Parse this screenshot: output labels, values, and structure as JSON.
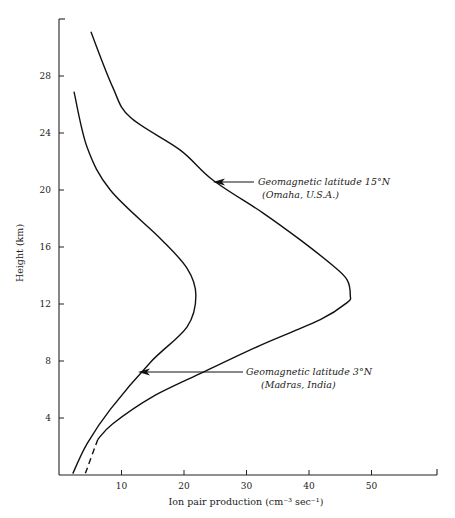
{
  "chart_data": {
    "type": "line",
    "title": "",
    "xlabel": "Ion pair production (cm⁻³ sec⁻¹)",
    "ylabel": "Height (km)",
    "xlim": [
      0,
      60
    ],
    "ylim": [
      0,
      32
    ],
    "x_ticks": [
      10,
      20,
      30,
      40,
      50
    ],
    "y_ticks": [
      4,
      8,
      12,
      16,
      20,
      24,
      28
    ],
    "grid": false,
    "legend": "none (inline annotations with arrows)",
    "series": [
      {
        "name": "Geomagnetic latitude 15°N (Omaha, U.S.A.)",
        "style": "solid; dashed below ~2.5 km",
        "points": [
          {
            "x": 5.1,
            "y": 31.1
          },
          {
            "x": 8.6,
            "y": 27.2
          },
          {
            "x": 11.4,
            "y": 25.1
          },
          {
            "x": 19.4,
            "y": 22.8
          },
          {
            "x": 24.6,
            "y": 20.7
          },
          {
            "x": 32.6,
            "y": 18.4
          },
          {
            "x": 38.6,
            "y": 16.5
          },
          {
            "x": 43.8,
            "y": 14.7
          },
          {
            "x": 46.1,
            "y": 13.7
          },
          {
            "x": 46.6,
            "y": 12.6
          },
          {
            "x": 46.1,
            "y": 12.1
          },
          {
            "x": 41.8,
            "y": 10.9
          },
          {
            "x": 32.2,
            "y": 9.1
          },
          {
            "x": 23.0,
            "y": 7.2
          },
          {
            "x": 15.0,
            "y": 5.5
          },
          {
            "x": 8.6,
            "y": 3.6
          },
          {
            "x": 6.2,
            "y": 2.5
          },
          {
            "x": 4.2,
            "y": 0.1
          }
        ]
      },
      {
        "name": "Geomagnetic latitude 3°N (Madras, India)",
        "style": "solid",
        "points": [
          {
            "x": 2.4,
            "y": 26.9
          },
          {
            "x": 4.5,
            "y": 23.0
          },
          {
            "x": 8.2,
            "y": 20.0
          },
          {
            "x": 16.2,
            "y": 16.6
          },
          {
            "x": 20.5,
            "y": 14.5
          },
          {
            "x": 21.9,
            "y": 12.6
          },
          {
            "x": 20.5,
            "y": 10.4
          },
          {
            "x": 14.6,
            "y": 7.9
          },
          {
            "x": 8.2,
            "y": 4.6
          },
          {
            "x": 4.5,
            "y": 2.2
          },
          {
            "x": 2.2,
            "y": 0.1
          }
        ]
      }
    ],
    "annotations": [
      {
        "line1": "Geomagnetic latitude 15°N",
        "line2": "(Omaha, U.S.A.)",
        "arrow_to": {
          "x": 24.6,
          "y": 20.6
        }
      },
      {
        "line1": "Geomagnetic latitude 3°N",
        "line2": "(Madras, India)",
        "arrow_to": {
          "x": 12.6,
          "y": 7.2
        }
      }
    ]
  },
  "labels": {
    "xlabel": "Ion pair production (cm⁻³ sec⁻¹)",
    "ylabel": "Height (km)",
    "omaha_line1": "Geomagnetic latitude 15°N",
    "omaha_line2": "(Omaha, U.S.A.)",
    "madras_line1": "Geomagnetic latitude 3°N",
    "madras_line2": "(Madras, India)"
  }
}
